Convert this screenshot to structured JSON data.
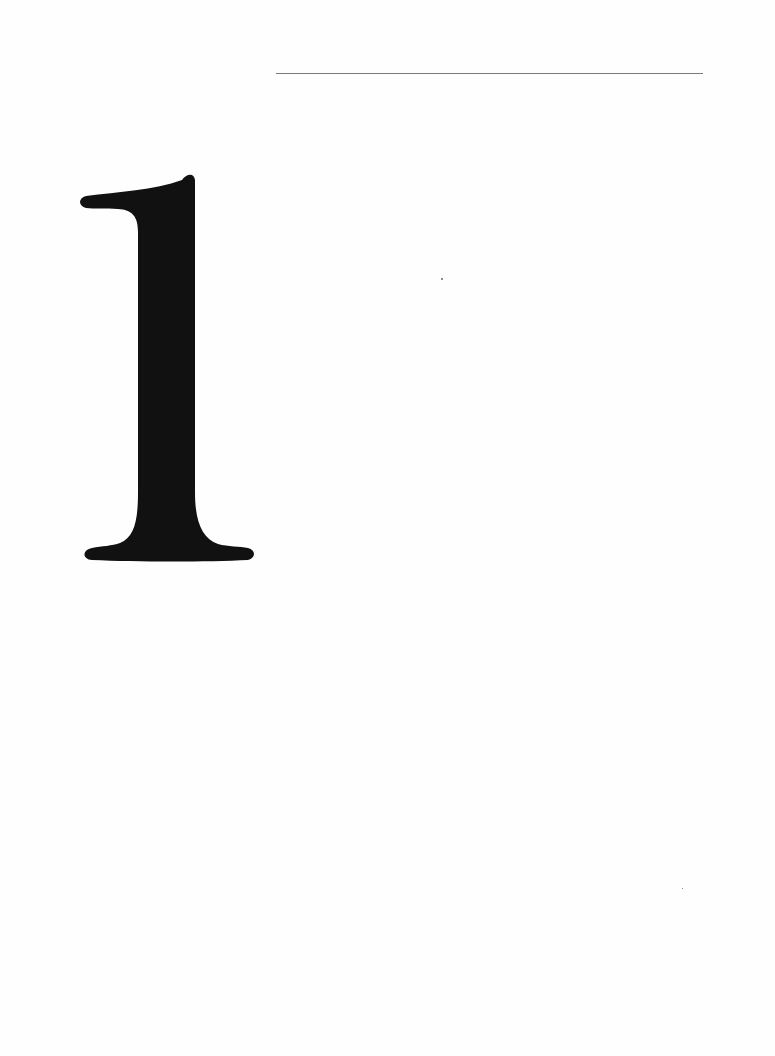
{
  "page": {
    "type": "chapter-opener",
    "chapter_number": "1",
    "colors": {
      "background": "#fefefe",
      "rule": "#7a7a7a",
      "numeral": "#111111"
    }
  }
}
